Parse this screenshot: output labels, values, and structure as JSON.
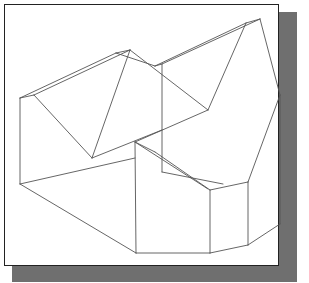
{
  "figure": {
    "frame": {
      "left": 4,
      "top": 4,
      "right": 278,
      "bottom": 265,
      "border_color": "#222222",
      "fill": "#ffffff"
    },
    "shadow": {
      "color": "#6f6f6f",
      "right": {
        "x": 279,
        "y": 12,
        "w": 18,
        "h": 270
      },
      "bottom": {
        "x": 12,
        "y": 266,
        "w": 285,
        "h": 16
      }
    },
    "stroke_color": "#555555",
    "edges": [
      [
        20,
        98,
        34,
        95
      ],
      [
        20,
        98,
        116,
        53
      ],
      [
        34,
        95,
        130,
        50
      ],
      [
        116,
        53,
        130,
        50
      ],
      [
        20,
        98,
        20,
        184
      ],
      [
        34,
        95,
        92,
        158
      ],
      [
        130,
        50,
        92,
        158
      ],
      [
        116,
        53,
        155,
        66
      ],
      [
        130,
        50,
        208,
        110
      ],
      [
        155,
        66,
        246,
        23
      ],
      [
        155,
        66,
        162,
        64
      ],
      [
        162,
        64,
        260,
        19
      ],
      [
        246,
        23,
        260,
        19
      ],
      [
        162,
        64,
        162,
        172
      ],
      [
        246,
        23,
        208,
        110
      ],
      [
        92,
        158,
        162,
        130
      ],
      [
        208,
        110,
        135,
        142
      ],
      [
        20,
        184,
        135,
        158
      ],
      [
        20,
        184,
        136,
        253
      ],
      [
        136,
        253,
        135,
        142
      ],
      [
        135,
        142,
        208,
        189
      ],
      [
        162,
        172,
        223,
        184
      ],
      [
        135,
        142,
        155,
        152
      ],
      [
        155,
        152,
        210,
        190
      ],
      [
        260,
        19,
        280,
        95
      ],
      [
        280,
        95,
        248,
        182
      ],
      [
        248,
        182,
        210,
        190
      ],
      [
        210,
        190,
        210,
        253
      ],
      [
        248,
        182,
        248,
        245
      ],
      [
        136,
        253,
        210,
        253
      ],
      [
        210,
        253,
        248,
        245
      ],
      [
        248,
        245,
        280,
        224
      ],
      [
        280,
        95,
        280,
        224
      ]
    ]
  }
}
